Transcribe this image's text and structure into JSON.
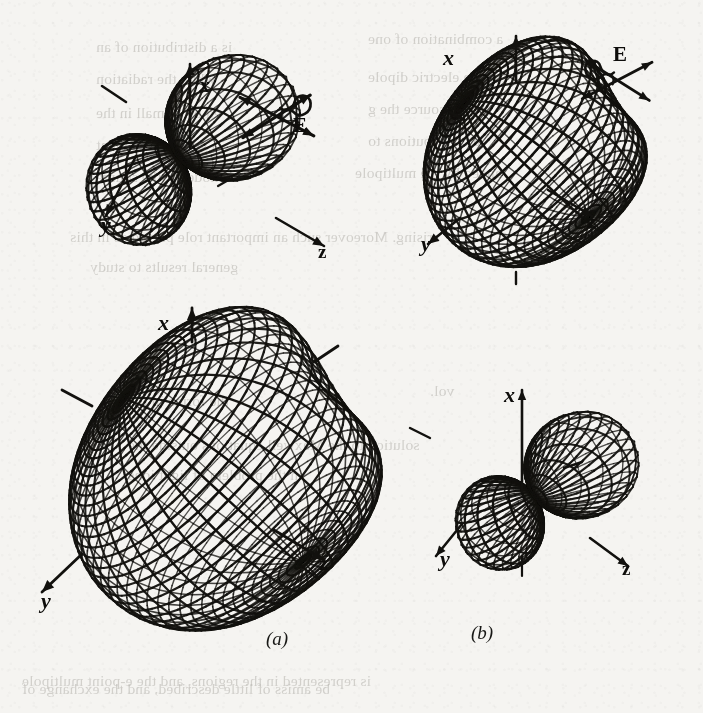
{
  "page": {
    "kind": "scanned-textbook-figure-page",
    "width": 703,
    "height": 713,
    "paper_color": "#f3f2ef",
    "ink_color": "#141310",
    "ghost_text_color": "#b9b7b2"
  },
  "captions": {
    "a": "(a)",
    "b": "(b)"
  },
  "figures": [
    {
      "id": "top-left",
      "name": "dipole-radiation-pattern-doughnut-lobes",
      "shape": "two-lobe-dumbbell",
      "axes": {
        "x": "x",
        "y": "y",
        "z": "z"
      },
      "field_label": "E",
      "field_symbol": "double-headed-arrow-with-loop",
      "x_axis_label": "x",
      "y_axis_label": "y",
      "z_axis_label": "z"
    },
    {
      "id": "top-right",
      "name": "scattering-pattern-oblate-spheroid",
      "shape": "spheroid-with-dimple",
      "axes": {
        "x": "x",
        "y": "y",
        "z": "z"
      },
      "field_label": "E",
      "field_symbol": "double-headed-arrow-with-loop",
      "x_axis_label": "x",
      "y_axis_label": "y",
      "z_axis_label": "z"
    },
    {
      "id": "bottom-left",
      "name": "large-radiation-pattern-spheroid",
      "shape": "large-spheroid-with-dimple",
      "axes": {
        "x": "x",
        "y": "y",
        "z": "z"
      },
      "field_label": null,
      "x_axis_label": "x",
      "y_axis_label": "y",
      "z_axis_label": "z"
    },
    {
      "id": "bottom-right",
      "name": "small-two-lobe-pattern",
      "shape": "two-lobe-dumbbell",
      "axes": {
        "x": "x",
        "y": "y",
        "z": "z"
      },
      "field_label": null,
      "x_axis_label": "x",
      "y_axis_label": "y",
      "z_axis_label": "z"
    }
  ],
  "ghost_lines": [
    {
      "text": "a combination of one",
      "x": 368,
      "y": 30
    },
    {
      "text": "is a distribution of an",
      "x": 96,
      "y": 38
    },
    {
      "text": "the the electric dipole",
      "x": 368,
      "y": 68
    },
    {
      "text": "while the radiation",
      "x": 96,
      "y": 70
    },
    {
      "text": "of the source the g",
      "x": 368,
      "y": 100
    },
    {
      "text": "ed by a small in the",
      "x": 96,
      "y": 104
    },
    {
      "text": "a contributions to",
      "x": 368,
      "y": 132
    },
    {
      "text": "a general treatment",
      "x": 96,
      "y": 136
    },
    {
      "text": "anded by the multipole",
      "x": 355,
      "y": 164
    },
    {
      "text": "a model of the source",
      "x": 96,
      "y": 168
    },
    {
      "text": "arising. Moreover such an important role played as in this",
      "x": 70,
      "y": 228
    },
    {
      "text": "general results to study",
      "x": 90,
      "y": 258
    },
    {
      "text": "the",
      "x": 516,
      "y": 250
    },
    {
      "text": "vol.",
      "x": 430,
      "y": 382
    },
    {
      "text": "the forms in the",
      "x": 128,
      "y": 392
    },
    {
      "text": "solution to the Maxwell equations outside the",
      "x": 128,
      "y": 436
    },
    {
      "text": "in the problem of light ions",
      "x": 128,
      "y": 466
    },
    {
      "text": "is represented in the regions, and the e-point multipole",
      "x": 22,
      "y": 672
    },
    {
      "text": "be amiss of little described, and the exchange of",
      "x": 22,
      "y": 680
    }
  ]
}
